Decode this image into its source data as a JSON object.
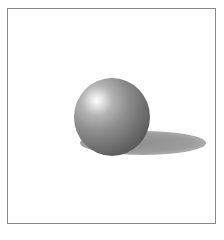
{
  "illustration": {
    "subject": "shaded sphere with cast shadow",
    "frame": {
      "border_color": "#8a8a8a",
      "background": "#ffffff"
    },
    "sphere": {
      "center": [
        112,
        117
      ],
      "radius": 38,
      "highlight_position": [
        97,
        101
      ],
      "colors": {
        "highlight": "#ffffff",
        "midtone": "#8e8e8e",
        "core_shadow": "#4a4a4a"
      }
    },
    "cast_shadow": {
      "center": [
        143,
        143
      ],
      "width": 126,
      "height": 24,
      "color": "#9c9c9c"
    }
  }
}
